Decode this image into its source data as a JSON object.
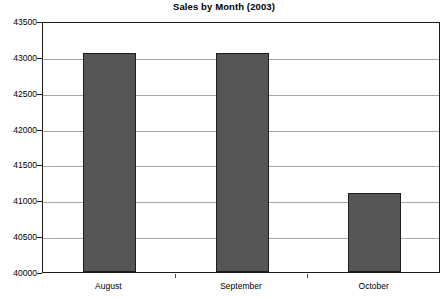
{
  "chart_data": {
    "type": "bar",
    "title": "Sales by Month (2003)",
    "xlabel": "",
    "ylabel": "",
    "categories": [
      "August",
      "September",
      "October"
    ],
    "values": [
      43060,
      43060,
      41100
    ],
    "series": [
      {
        "name": "Sales",
        "values": [
          43060,
          43060,
          41100
        ]
      }
    ],
    "ylim": [
      40000,
      43500
    ],
    "yticks": [
      40000,
      40500,
      41000,
      41500,
      42000,
      42500,
      43000,
      43500
    ],
    "ytick_labels": [
      "40000",
      "40500",
      "41000",
      "41500",
      "42000",
      "42500",
      "43000",
      "43500"
    ],
    "grid": true,
    "legend": false,
    "legend_position": "none",
    "bar_color": "#565656",
    "bar_border_color": "#1d1d1d",
    "gridline_color": "#a8a8a8",
    "axis_color": "#1a1a1a",
    "background_color": "#ffffff"
  }
}
